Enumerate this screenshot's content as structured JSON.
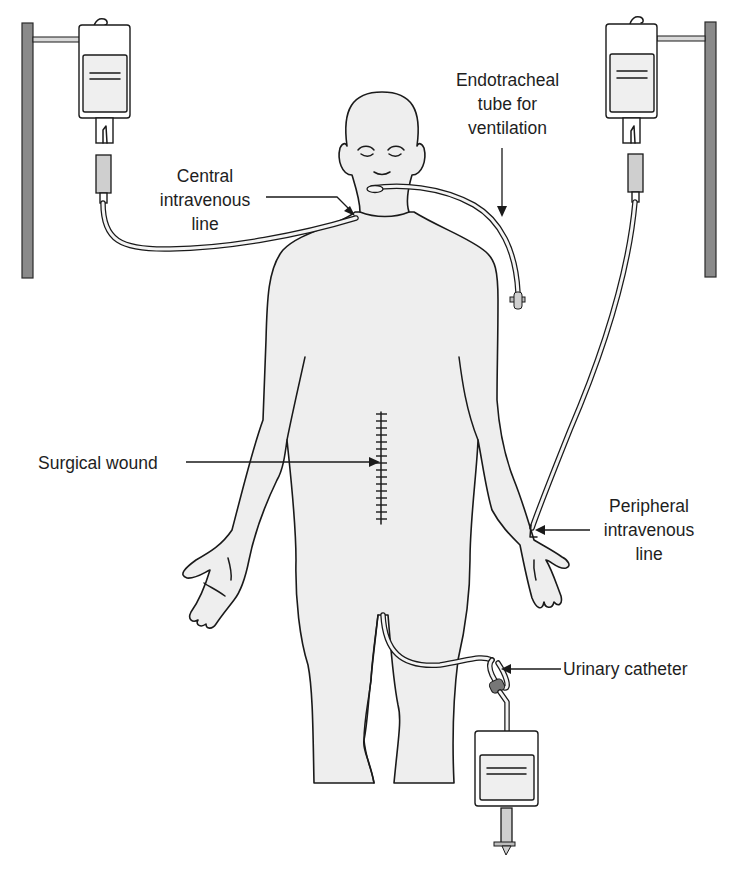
{
  "figure": {
    "type": "medical illustration",
    "colors": {
      "outline": "#1a1a1a",
      "skin_fill": "#eeeeee",
      "pole": "#8a8a8a",
      "background": "#ffffff"
    }
  },
  "labels": {
    "central_line": {
      "lines": [
        "Central",
        "intravenous",
        "line"
      ]
    },
    "endotracheal_tube": {
      "lines": [
        "Endotracheal",
        "tube for",
        "ventilation"
      ]
    },
    "surgical_wound": {
      "lines": [
        "Surgical wound"
      ]
    },
    "peripheral_line": {
      "lines": [
        "Peripheral",
        "intravenous",
        "line"
      ]
    },
    "urinary_catheter": {
      "lines": [
        "Urinary catheter"
      ]
    }
  },
  "devices": [
    {
      "id": "iv-pole-left",
      "kind": "iv-pole"
    },
    {
      "id": "iv-bag-left",
      "kind": "iv-bag",
      "connects_to": "central_line"
    },
    {
      "id": "iv-pole-right",
      "kind": "iv-pole"
    },
    {
      "id": "iv-bag-right",
      "kind": "iv-bag",
      "connects_to": "peripheral_line"
    },
    {
      "id": "endotracheal-tube",
      "kind": "tube"
    },
    {
      "id": "urine-bag",
      "kind": "drainage-bag",
      "connects_to": "urinary_catheter"
    }
  ]
}
